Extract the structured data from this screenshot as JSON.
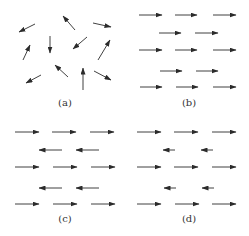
{
  "figure": {
    "panels": [
      {
        "label": "(a)",
        "description": "Randomly oriented magnetic moments (paramagnet)",
        "arrows": [
          {
            "x1": 35,
            "y1": 24,
            "x2": 19,
            "y2": 32
          },
          {
            "x1": 75,
            "y1": 30,
            "x2": 63,
            "y2": 16
          },
          {
            "x1": 93,
            "y1": 23,
            "x2": 111,
            "y2": 27
          },
          {
            "x1": 50,
            "y1": 36,
            "x2": 50,
            "y2": 53
          },
          {
            "x1": 87,
            "y1": 37,
            "x2": 73,
            "y2": 49
          },
          {
            "x1": 23,
            "y1": 60,
            "x2": 30,
            "y2": 45
          },
          {
            "x1": 98,
            "y1": 60,
            "x2": 110,
            "y2": 40
          },
          {
            "x1": 68,
            "y1": 77,
            "x2": 55,
            "y2": 65
          },
          {
            "x1": 41,
            "y1": 75,
            "x2": 26,
            "y2": 83
          },
          {
            "x1": 83,
            "y1": 90,
            "x2": 83,
            "y2": 68
          },
          {
            "x1": 94,
            "y1": 71,
            "x2": 111,
            "y2": 80
          }
        ],
        "label_pos": {
          "x": 65,
          "y": 106
        }
      },
      {
        "label": "(b)",
        "description": "All moments aligned parallel (ferromagnet)",
        "arrows": [
          {
            "x1": 139,
            "y1": 15,
            "x2": 162,
            "y2": 15
          },
          {
            "x1": 175,
            "y1": 15,
            "x2": 197,
            "y2": 15
          },
          {
            "x1": 213,
            "y1": 15,
            "x2": 236,
            "y2": 15
          },
          {
            "x1": 159,
            "y1": 33,
            "x2": 181,
            "y2": 33
          },
          {
            "x1": 195,
            "y1": 33,
            "x2": 218,
            "y2": 33
          },
          {
            "x1": 139,
            "y1": 50,
            "x2": 162,
            "y2": 50
          },
          {
            "x1": 175,
            "y1": 50,
            "x2": 197,
            "y2": 50
          },
          {
            "x1": 213,
            "y1": 50,
            "x2": 236,
            "y2": 50
          },
          {
            "x1": 160,
            "y1": 71,
            "x2": 182,
            "y2": 71
          },
          {
            "x1": 196,
            "y1": 71,
            "x2": 218,
            "y2": 71
          },
          {
            "x1": 140,
            "y1": 87,
            "x2": 162,
            "y2": 87
          },
          {
            "x1": 176,
            "y1": 87,
            "x2": 198,
            "y2": 87
          },
          {
            "x1": 213,
            "y1": 87,
            "x2": 236,
            "y2": 87
          }
        ],
        "label_pos": {
          "x": 189,
          "y": 106
        }
      },
      {
        "label": "(c)",
        "description": "Equal antiparallel moments (antiferromagnet)",
        "arrows": [
          {
            "x1": 15,
            "y1": 132,
            "x2": 39,
            "y2": 132
          },
          {
            "x1": 52,
            "y1": 132,
            "x2": 76,
            "y2": 132
          },
          {
            "x1": 90,
            "y1": 132,
            "x2": 114,
            "y2": 132
          },
          {
            "x1": 62,
            "y1": 150,
            "x2": 39,
            "y2": 150
          },
          {
            "x1": 99,
            "y1": 150,
            "x2": 76,
            "y2": 150
          },
          {
            "x1": 15,
            "y1": 167,
            "x2": 39,
            "y2": 167
          },
          {
            "x1": 53,
            "y1": 167,
            "x2": 77,
            "y2": 167
          },
          {
            "x1": 91,
            "y1": 167,
            "x2": 115,
            "y2": 167
          },
          {
            "x1": 62,
            "y1": 188,
            "x2": 39,
            "y2": 188
          },
          {
            "x1": 99,
            "y1": 188,
            "x2": 76,
            "y2": 188
          },
          {
            "x1": 15,
            "y1": 204,
            "x2": 39,
            "y2": 204
          },
          {
            "x1": 53,
            "y1": 204,
            "x2": 77,
            "y2": 204
          },
          {
            "x1": 91,
            "y1": 204,
            "x2": 115,
            "y2": 204
          }
        ],
        "label_pos": {
          "x": 65,
          "y": 222
        }
      },
      {
        "label": "(d)",
        "description": "Unequal antiparallel moments (ferrimagnet)",
        "arrows": [
          {
            "x1": 137,
            "y1": 132,
            "x2": 161,
            "y2": 132
          },
          {
            "x1": 174,
            "y1": 132,
            "x2": 198,
            "y2": 132
          },
          {
            "x1": 212,
            "y1": 132,
            "x2": 236,
            "y2": 132
          },
          {
            "x1": 175,
            "y1": 150,
            "x2": 163,
            "y2": 150
          },
          {
            "x1": 213,
            "y1": 150,
            "x2": 201,
            "y2": 150
          },
          {
            "x1": 137,
            "y1": 167,
            "x2": 161,
            "y2": 167
          },
          {
            "x1": 174,
            "y1": 167,
            "x2": 198,
            "y2": 167
          },
          {
            "x1": 212,
            "y1": 167,
            "x2": 236,
            "y2": 167
          },
          {
            "x1": 176,
            "y1": 188,
            "x2": 164,
            "y2": 188
          },
          {
            "x1": 214,
            "y1": 188,
            "x2": 202,
            "y2": 188
          },
          {
            "x1": 137,
            "y1": 204,
            "x2": 161,
            "y2": 204
          },
          {
            "x1": 175,
            "y1": 204,
            "x2": 199,
            "y2": 204
          },
          {
            "x1": 212,
            "y1": 204,
            "x2": 236,
            "y2": 204
          }
        ],
        "label_pos": {
          "x": 189,
          "y": 222
        }
      }
    ],
    "colors": {
      "arrow": "#2b2b2b",
      "label": "#333333",
      "background": "#ffffff"
    }
  }
}
